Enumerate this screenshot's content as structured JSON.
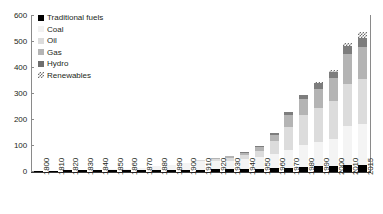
{
  "chart_data": {
    "type": "bar",
    "stacked": true,
    "title": "",
    "xlabel": "",
    "ylabel": "",
    "ylim": [
      0,
      600
    ],
    "ytick_step": 100,
    "yticks": [
      0,
      100,
      200,
      300,
      400,
      500,
      600
    ],
    "grid": false,
    "legend_position": "top-left",
    "categories": [
      "1800",
      "1810",
      "1820",
      "1830",
      "1840",
      "1850",
      "1860",
      "1870",
      "1880",
      "1890",
      "1900",
      "1910",
      "1920",
      "1930",
      "1940",
      "1950",
      "1960",
      "1970",
      "1980",
      "1990",
      "2000",
      "2010",
      "2015"
    ],
    "series": [
      {
        "name": "Traditional fuels",
        "color": "#000000",
        "values": [
          5.6,
          5.8,
          6.0,
          6.2,
          6.5,
          6.8,
          7.1,
          7.5,
          8.0,
          8.5,
          9.0,
          9.6,
          10.2,
          10.8,
          11.5,
          12.5,
          14.0,
          16.0,
          19.0,
          22.0,
          24.5,
          26.0,
          27.0
        ]
      },
      {
        "name": "Coal",
        "color": "#f4f4f4",
        "values": [
          0.3,
          0.5,
          0.8,
          1.2,
          2.0,
          3.5,
          6.0,
          9.5,
          14.0,
          19.5,
          25.0,
          32.0,
          34.0,
          33.0,
          38.0,
          44.0,
          56.0,
          68.0,
          83.0,
          95.0,
          101.0,
          150.0,
          157.0
        ]
      },
      {
        "name": "Oil",
        "color": "#dcdcdc",
        "values": [
          0,
          0,
          0,
          0,
          0,
          0,
          0.1,
          0.3,
          0.6,
          1.2,
          2.0,
          4.0,
          7.0,
          12.0,
          17.0,
          26.0,
          48.0,
          89.0,
          117.0,
          129.0,
          146.0,
          163.0,
          173.0
        ]
      },
      {
        "name": "Gas",
        "color": "#b4b4b4",
        "values": [
          0,
          0,
          0,
          0,
          0,
          0,
          0,
          0,
          0.1,
          0.3,
          0.6,
          1.5,
          3.0,
          5.0,
          8.0,
          13.0,
          26.0,
          45.0,
          61.0,
          74.0,
          90.0,
          114.0,
          125.0
        ]
      },
      {
        "name": "Hydro",
        "color": "#7d7d7d",
        "values": [
          0,
          0,
          0,
          0,
          0,
          0,
          0,
          0,
          0,
          0.1,
          0.3,
          0.8,
          1.5,
          2.5,
          3.5,
          5.0,
          8.0,
          12.0,
          16.0,
          21.0,
          25.0,
          31.0,
          35.0
        ]
      },
      {
        "name": "Renewables",
        "color": "#6e6e6e",
        "pattern": "checkered",
        "values": [
          0,
          0,
          0,
          0,
          0,
          0,
          0,
          0,
          0,
          0,
          0,
          0,
          0,
          0,
          0,
          0,
          0.3,
          1.0,
          2.0,
          4.0,
          7.0,
          14.0,
          22.0
        ]
      }
    ],
    "legend": [
      {
        "label": "Traditional fuels",
        "swatch_class": "sw-traditional"
      },
      {
        "label": "Coal",
        "swatch_class": "sw-coal"
      },
      {
        "label": "Oil",
        "swatch_class": "sw-oil"
      },
      {
        "label": "Gas",
        "swatch_class": "sw-gas"
      },
      {
        "label": "Hydro",
        "swatch_class": "sw-hydro"
      },
      {
        "label": "Renewables",
        "swatch_class": "sw-renewables"
      }
    ]
  }
}
